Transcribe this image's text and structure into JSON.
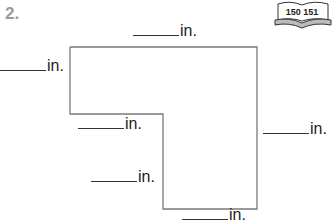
{
  "problem": {
    "number": "2.",
    "book_icon": {
      "name": "book-icon",
      "pages": "150 151"
    },
    "unit": "in.",
    "labels": [
      {
        "id": "top",
        "text": "in."
      },
      {
        "id": "left-upper",
        "text": "in."
      },
      {
        "id": "left-middle",
        "text": "in."
      },
      {
        "id": "right",
        "text": "in."
      },
      {
        "id": "left-lower",
        "text": "in."
      },
      {
        "id": "bottom",
        "text": "in."
      }
    ]
  }
}
